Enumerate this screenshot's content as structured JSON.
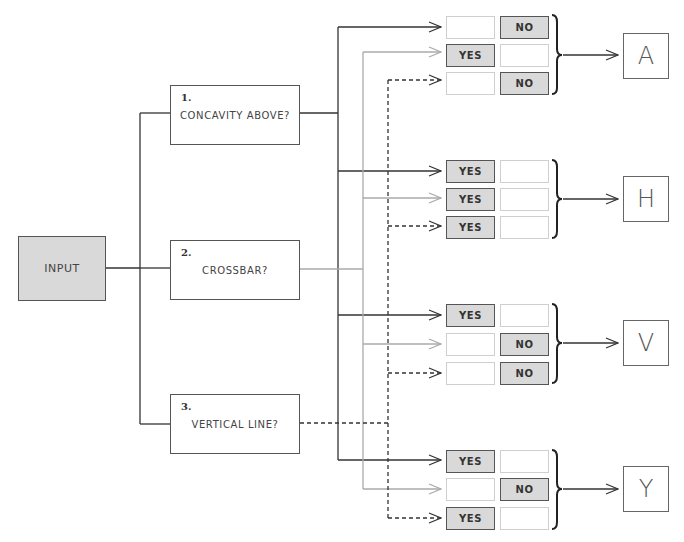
{
  "input": {
    "label": "INPUT"
  },
  "questions": [
    {
      "number": "1.",
      "text": "CONCAVITY ABOVE?"
    },
    {
      "number": "2.",
      "text": "CROSSBAR?"
    },
    {
      "number": "3.",
      "text": "VERTICAL LINE?"
    }
  ],
  "line_styles": {
    "question_1": "solid-dark",
    "question_2": "solid-gray",
    "question_3": "dashed-dark"
  },
  "colors": {
    "dark_line": "#333333",
    "gray_line": "#aaaaaa",
    "filled_cell": "#d9d9d9",
    "empty_cell_border": "#cfcfcf"
  },
  "groups": [
    {
      "letter": "A",
      "rows": [
        {
          "yes": "",
          "no": "NO"
        },
        {
          "yes": "YES",
          "no": ""
        },
        {
          "yes": "",
          "no": "NO"
        }
      ]
    },
    {
      "letter": "H",
      "rows": [
        {
          "yes": "YES",
          "no": ""
        },
        {
          "yes": "YES",
          "no": ""
        },
        {
          "yes": "YES",
          "no": ""
        }
      ]
    },
    {
      "letter": "V",
      "rows": [
        {
          "yes": "YES",
          "no": ""
        },
        {
          "yes": "",
          "no": "NO"
        },
        {
          "yes": "",
          "no": "NO"
        }
      ]
    },
    {
      "letter": "Y",
      "rows": [
        {
          "yes": "YES",
          "no": ""
        },
        {
          "yes": "",
          "no": "NO"
        },
        {
          "yes": "YES",
          "no": ""
        }
      ]
    }
  ]
}
